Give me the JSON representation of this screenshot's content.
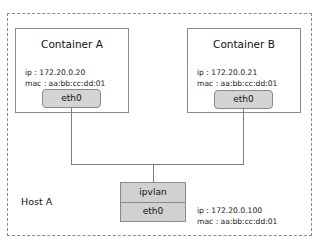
{
  "host": {
    "label": "Host A",
    "ip": "ip : 172.20.0.100",
    "mac": "mac : aa:bb:cc:dd:01",
    "stack": {
      "top": "ipvlan",
      "bottom": "eth0"
    }
  },
  "containers": [
    {
      "title": "Container A",
      "ip": "ip : 172.20.0.20",
      "mac": "mac : aa:bb:cc:dd:01",
      "iface": "eth0"
    },
    {
      "title": "Container B",
      "ip": "ip : 172.20.0.21",
      "mac": "mac : aa:bb:cc:dd:01",
      "iface": "eth0"
    }
  ],
  "colors": {
    "border": "#8a8a8a",
    "interface_fill": "#d4d4d4",
    "line": "#7d7d7d"
  }
}
